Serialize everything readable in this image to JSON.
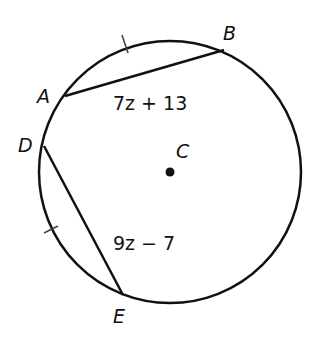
{
  "figure": {
    "type": "circle-chords",
    "circle": {
      "center_label": "C",
      "cx": 170,
      "cy": 172,
      "r": 131
    },
    "points": [
      {
        "label": "A",
        "x": 65,
        "y": 96,
        "lx": 37,
        "ly": 103
      },
      {
        "label": "B",
        "x": 224,
        "y": 50,
        "lx": 223,
        "ly": 40
      },
      {
        "label": "D",
        "x": 44,
        "y": 146,
        "lx": 18,
        "ly": 152
      },
      {
        "label": "E",
        "x": 123,
        "y": 295,
        "lx": 113,
        "ly": 323
      }
    ],
    "chords": [
      {
        "name": "AB",
        "from": "A",
        "to": "B",
        "expression": "7z + 13",
        "ex": 113,
        "ey": 110
      },
      {
        "name": "DE",
        "from": "D",
        "to": "E",
        "expression": "9z − 7",
        "ex": 113,
        "ey": 250
      }
    ],
    "congruence_ticks": [
      {
        "arc": "AB",
        "x": 125,
        "y": 44,
        "angle": 70
      },
      {
        "arc": "DE",
        "x": 51,
        "y": 230,
        "angle": -20
      }
    ],
    "stroke_color": "#111111"
  }
}
